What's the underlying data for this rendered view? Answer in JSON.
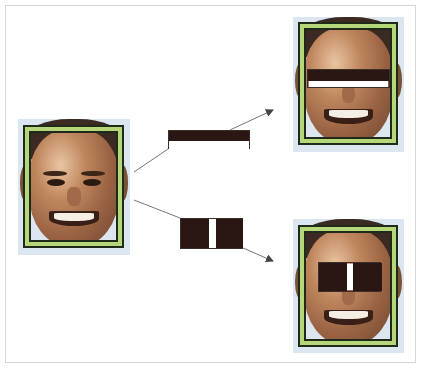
{
  "figure": {
    "colors": {
      "frame_border": "#d6d6d6",
      "bbox_dark": "#1f2a1a",
      "bbox_green": "#b5d77a",
      "feature_dark": "#2a1714",
      "feature_light": "#ffffff",
      "arrow": "#555555"
    },
    "source_face": {
      "label": ""
    },
    "features": [
      {
        "name": "two-rectangle-horizontal-edge",
        "orientation": "horizontal",
        "layout": "dark top, light bottom"
      },
      {
        "name": "three-rectangle-vertical-line",
        "orientation": "vertical",
        "layout": "dark-light-dark"
      }
    ],
    "results": [
      {
        "name": "edge-feature-on-eyes",
        "placement": "across eyes"
      },
      {
        "name": "line-feature-on-nose-bridge",
        "placement": "across eyes and nose bridge"
      }
    ]
  }
}
